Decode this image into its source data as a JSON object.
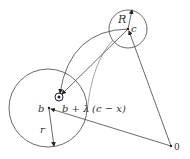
{
  "diagram": {
    "labels": {
      "R": "R",
      "c": "c",
      "b": "b",
      "r": "r",
      "origin": "0",
      "expr_b": "b + λ",
      "expr_paren": "(c − x)"
    },
    "colors": {
      "stroke": "#333333",
      "background": "#ffffff"
    },
    "elements": {
      "large_circle": {
        "cx": 48,
        "cy": 108,
        "r": 39,
        "center_label": "b",
        "radius_label": "r"
      },
      "small_circle": {
        "cx": 128,
        "cy": 29,
        "r": 19,
        "center_label": "c",
        "radius_label": "R"
      },
      "tiny_circle": {
        "cx": 59,
        "cy": 97,
        "r": 4
      },
      "origin_point": {
        "x": 171,
        "y": 146,
        "label": "0"
      },
      "arrows": [
        {
          "from": "0",
          "to": "b"
        },
        {
          "from": "0",
          "to": "c"
        },
        {
          "from": "c",
          "to": "tiny_circle"
        },
        {
          "from": "b",
          "to": "large_circle_edge",
          "label": "r"
        },
        {
          "from": "c",
          "to": "small_circle_edge",
          "label": "R"
        },
        {
          "from": "c",
          "to": "tiny_circle",
          "type": "curved_arc"
        }
      ]
    }
  }
}
